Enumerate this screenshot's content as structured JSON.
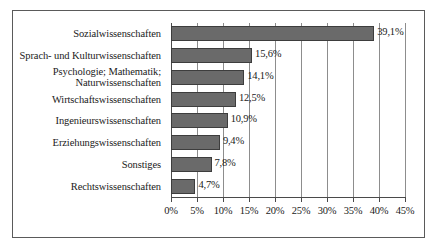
{
  "chart_data": {
    "type": "bar",
    "orientation": "horizontal",
    "title": "",
    "subtitle": "",
    "xlabel": "",
    "ylabel": "",
    "xlim": [
      0,
      45
    ],
    "grid": true,
    "legend": false,
    "bar_color": "#6a6a6a",
    "bar_border_color": "#3d3d3d",
    "axis_color": "#4a4a4a",
    "gridline_color": "#8d8d8d",
    "border_color": "#5a5a5a",
    "background": "#ffffff",
    "value_suffix": "%",
    "decimal_separator": ",",
    "categories": [
      "Sozialwissenschaften",
      "Sprach- und Kulturwissenschaften",
      "Psychologie; Mathematik;\nNaturwissenschaften",
      "Wirtschaftswissenschaften",
      "Ingenieurswissenschaften",
      "Erziehungswissenschaften",
      "Sonstiges",
      "Rechtswissenschaften"
    ],
    "values": [
      39.1,
      15.6,
      14.1,
      12.5,
      10.9,
      9.4,
      7.8,
      4.7
    ],
    "data_labels": [
      "39,1%",
      "15,6%",
      "14,1%",
      "12,5%",
      "10,9%",
      "9,4%",
      "7,8%",
      "4,7%"
    ],
    "xticks": [
      0,
      5,
      10,
      15,
      20,
      25,
      30,
      35,
      40,
      45
    ],
    "xticklabels": [
      "0%",
      "5%",
      "10%",
      "15%",
      "20%",
      "25%",
      "30%",
      "35%",
      "40%",
      "45%"
    ]
  }
}
